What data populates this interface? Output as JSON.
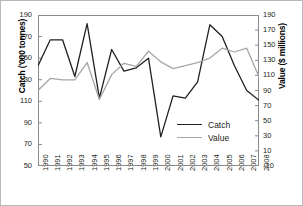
{
  "chart_data": {
    "type": "line",
    "title": "",
    "xlabel": "",
    "ylabel": "Catch ('000 tonnes)",
    "y2label": "Value ($ millions)",
    "categories": [
      "1990",
      "1991",
      "1992",
      "1993",
      "1994",
      "1995",
      "1996",
      "1997",
      "1998",
      "1999",
      "2000",
      "2001",
      "2002",
      "2003",
      "2004",
      "2005",
      "2006",
      "2007",
      "2008"
    ],
    "ylim": [
      50,
      190
    ],
    "yticks": [
      50,
      70,
      90,
      110,
      130,
      150,
      170,
      190
    ],
    "y2lim": [
      -10,
      190
    ],
    "y2ticks": [
      -10,
      10,
      30,
      50,
      70,
      90,
      110,
      130,
      150,
      170,
      190
    ],
    "grid": false,
    "legend_position": "inside-bottom-right",
    "series": [
      {
        "name": "Catch",
        "axis": "left",
        "color": "#231f20",
        "values": [
          143,
          167,
          167,
          133,
          182,
          113,
          158,
          138,
          141,
          150,
          77,
          115,
          113,
          128,
          181,
          170,
          143,
          120,
          111
        ]
      },
      {
        "name": "Value",
        "axis": "right",
        "color": "#a6a6a6",
        "values": [
          90,
          106,
          104,
          104,
          127,
          78,
          111,
          126,
          122,
          142,
          128,
          119,
          123,
          127,
          133,
          146,
          141,
          146,
          108
        ]
      }
    ]
  },
  "legend": {
    "items": [
      {
        "label": "Catch",
        "color": "#231f20"
      },
      {
        "label": "Value",
        "color": "#a6a6a6"
      }
    ]
  }
}
